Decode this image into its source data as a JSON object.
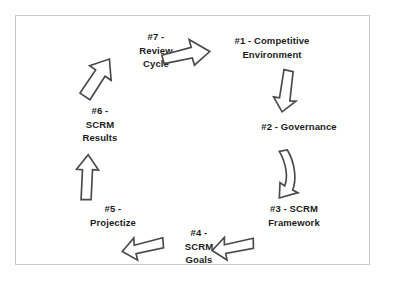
{
  "diagram": {
    "background_color": "#ffffff",
    "border_color": "#c9c9c9",
    "text_color": "#1c1c1c",
    "arrow_fill": "#ffffff",
    "arrow_stroke": "#4a4a4a",
    "nodes": [
      {
        "id": "1",
        "label": "#1 - Competitive\nEnvironment"
      },
      {
        "id": "2",
        "label": "#2 - Governance"
      },
      {
        "id": "3",
        "label": "#3 - SCRM\nFramework"
      },
      {
        "id": "4",
        "label": "#4 -\nSCRM\nGoals"
      },
      {
        "id": "5",
        "label": "#5 -\nProjectize"
      },
      {
        "id": "6",
        "label": "#6 -\nSCRM\nResults"
      },
      {
        "id": "7",
        "label": "#7 -\nReview\nCycle"
      }
    ],
    "arrows": [
      {
        "id": "7-1",
        "from": "7",
        "to": "1",
        "direction": "right"
      },
      {
        "id": "1-2",
        "from": "1",
        "to": "2",
        "direction": "down"
      },
      {
        "id": "2-3",
        "from": "2",
        "to": "3",
        "direction": "down-left-curved"
      },
      {
        "id": "3-4",
        "from": "3",
        "to": "4",
        "direction": "left"
      },
      {
        "id": "4-5",
        "from": "4",
        "to": "5",
        "direction": "left"
      },
      {
        "id": "5-6",
        "from": "5",
        "to": "6",
        "direction": "up"
      },
      {
        "id": "6-7",
        "from": "6",
        "to": "7",
        "direction": "up-right"
      }
    ]
  }
}
